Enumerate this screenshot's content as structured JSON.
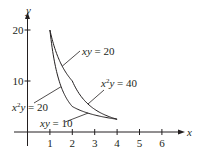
{
  "chart_data": {
    "type": "line",
    "title": "",
    "xlabel": "x",
    "ylabel": "y",
    "xlim": [
      -0.9,
      7.2
    ],
    "ylim": [
      -3.5,
      25.5
    ],
    "grid": false,
    "legend": "none",
    "x_ticks": [
      1,
      2,
      3,
      4,
      5,
      6
    ],
    "x_tick_labels": [
      "1",
      "2",
      "3",
      "4",
      "5",
      "6"
    ],
    "y_ticks": [
      10,
      20
    ],
    "y_tick_labels": [
      "10",
      "20"
    ],
    "series": [
      {
        "name": "xy = 20",
        "equation": "y = 20/x",
        "x_range": [
          1,
          2
        ]
      },
      {
        "name": "x^2 y = 40",
        "equation": "y = 40/x^2",
        "x_range": [
          2,
          4
        ]
      },
      {
        "name": "x^2 y = 20",
        "equation": "y = 20/x^2",
        "x_range": [
          1,
          2
        ]
      },
      {
        "name": "xy = 10",
        "equation": "y = 10/x",
        "x_range": [
          2,
          4
        ]
      }
    ],
    "annotations": [
      {
        "text_parts": [
          "xy",
          " = 20"
        ],
        "points_to": "xy = 20",
        "at": [
          1.55,
          12.9
        ]
      },
      {
        "text_parts": [
          "x",
          "2",
          "y",
          " = 40"
        ],
        "points_to": "x^2 y = 40",
        "at": [
          2.9,
          6.6
        ]
      },
      {
        "text_parts": [
          "x",
          "2",
          "y",
          " = 20"
        ],
        "points_to": "x^2 y = 20",
        "at": [
          1.3,
          10.0
        ]
      },
      {
        "text_parts": [
          "xy",
          " = 10"
        ],
        "points_to": "xy = 10",
        "at": [
          2.8,
          4.1
        ]
      }
    ]
  }
}
